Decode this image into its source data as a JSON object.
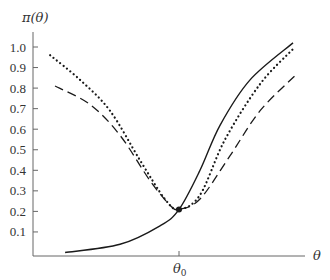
{
  "chart_data": {
    "type": "line",
    "title": "",
    "xlabel": "θ",
    "ylabel": "π(θ)",
    "ylim": [
      0,
      1.05
    ],
    "yticks": [
      "1.0",
      "0.9",
      "0.8",
      "0.7",
      "0.6",
      "0.5",
      "0.4",
      "0.3",
      "0.2",
      "0.1"
    ],
    "xticks": [
      {
        "label": "θ0",
        "x": 0.537
      }
    ],
    "grid": false,
    "legend": null,
    "annotations": [
      {
        "type": "point",
        "x": 0.537,
        "y": 0.21,
        "label": "common point at θ0"
      }
    ],
    "series": [
      {
        "name": "solid",
        "style": "solid",
        "x": [
          0.118,
          0.32,
          0.467,
          0.537,
          0.614,
          0.688,
          0.798,
          0.956
        ],
        "y": [
          0.0,
          0.04,
          0.13,
          0.21,
          0.4,
          0.62,
          0.84,
          1.02
        ]
      },
      {
        "name": "dotted",
        "style": "dotted",
        "x": [
          0.063,
          0.173,
          0.283,
          0.393,
          0.485,
          0.537,
          0.614,
          0.706,
          0.835,
          0.956
        ],
        "y": [
          0.96,
          0.84,
          0.69,
          0.45,
          0.26,
          0.21,
          0.28,
          0.55,
          0.82,
          0.99
        ]
      },
      {
        "name": "dashed",
        "style": "dashed",
        "x": [
          0.081,
          0.21,
          0.32,
          0.43,
          0.504,
          0.537,
          0.614,
          0.724,
          0.835,
          0.971
        ],
        "y": [
          0.81,
          0.72,
          0.57,
          0.35,
          0.23,
          0.21,
          0.26,
          0.47,
          0.69,
          0.87
        ]
      }
    ]
  },
  "labels": {
    "ylabel": "π(θ)",
    "xlabel": "θ",
    "theta0": "θ",
    "theta0_sub": "0"
  },
  "colors": {
    "axis": "#666666",
    "curve": "#1a1a1a",
    "text": "#333333"
  }
}
